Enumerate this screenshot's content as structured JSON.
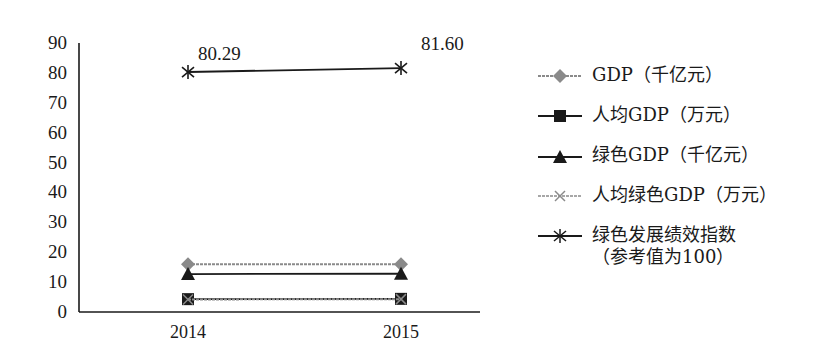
{
  "chart_data": {
    "type": "line",
    "title": "",
    "xlabel": "",
    "ylabel": "",
    "categories": [
      "2014",
      "2015"
    ],
    "ylim": [
      0,
      90
    ],
    "yticks": [
      0,
      10,
      20,
      30,
      40,
      50,
      60,
      70,
      80,
      90
    ],
    "grid": false,
    "legend_position": "right",
    "series": [
      {
        "name": "GDP（千亿元）",
        "marker": "diamond",
        "color": "#8a8a8a",
        "line_style": "dashed",
        "values": [
          16.0,
          16.0
        ]
      },
      {
        "name": "人均GDP（万元）",
        "marker": "square",
        "color": "#1a1a1a",
        "line_style": "solid",
        "values": [
          4.3,
          4.4
        ]
      },
      {
        "name": "绿色GDP（千亿元）",
        "marker": "triangle",
        "color": "#1a1a1a",
        "line_style": "solid",
        "values": [
          12.7,
          12.8
        ]
      },
      {
        "name": "人均绿色GDP（万元）",
        "marker": "x",
        "color": "#8a8a8a",
        "line_style": "dashed",
        "values": [
          4.2,
          4.3
        ]
      },
      {
        "name": "绿色发展绩效指数（参考值为100）",
        "marker": "star",
        "color": "#1a1a1a",
        "line_style": "solid",
        "values": [
          80.29,
          81.6
        ]
      }
    ],
    "annotations": [
      {
        "x": "2014",
        "y": 80.29,
        "text": "80.29"
      },
      {
        "x": "2015",
        "y": 81.6,
        "text": "81.60"
      }
    ]
  },
  "legend": {
    "items": [
      {
        "label": "GDP（千亿元）"
      },
      {
        "label": "人均GDP（万元）"
      },
      {
        "label": "绿色GDP（千亿元）"
      },
      {
        "label": "人均绿色GDP（万元）"
      },
      {
        "label": "绿色发展绩效指数",
        "sub": "（参考值为100）"
      }
    ]
  }
}
